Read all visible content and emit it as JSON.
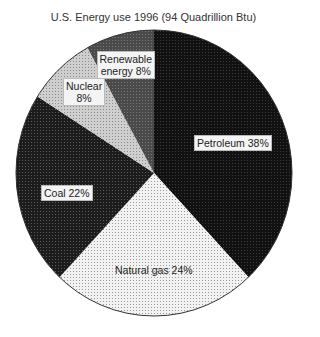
{
  "chart_data": {
    "type": "pie",
    "title": "U.S. Energy use 1996 (94 Quadrillion Btu)",
    "categories": [
      "Petroleum",
      "Natural gas",
      "Coal",
      "Nuclear",
      "Renewable energy"
    ],
    "values": [
      38,
      24,
      22,
      8,
      8
    ],
    "units": "%",
    "start_angle_deg": 0,
    "direction": "clockwise",
    "slices": [
      {
        "name": "Petroleum",
        "value": 38,
        "label": "Petroleum 38%",
        "fill": "#111111",
        "dot": "#3a3a3a",
        "label_x": 233,
        "label_y": 143,
        "boxed": true
      },
      {
        "name": "Natural gas",
        "value": 24,
        "label": "Natural gas 24%",
        "fill": "#f2f2f2",
        "dot": "#9a9a9a",
        "label_x": 154,
        "label_y": 270,
        "boxed": false
      },
      {
        "name": "Coal",
        "value": 22,
        "label": "Coal 22%",
        "fill": "#1c1c1c",
        "dot": "#5a5a5a",
        "label_x": 67,
        "label_y": 193,
        "boxed": true
      },
      {
        "name": "Nuclear",
        "value": 8,
        "label": "Nuclear\n8%",
        "fill": "#cfcfcf",
        "dot": "#8a8a8a",
        "label_x": 84,
        "label_y": 92,
        "boxed": true
      },
      {
        "name": "Renewable energy",
        "value": 8,
        "label": "Renewable\nenergy 8%",
        "fill": "#4a4a4a",
        "dot": "#7a7a7a",
        "label_x": 126,
        "label_y": 65,
        "boxed": true
      }
    ],
    "legend": "none",
    "grid": false
  },
  "geometry": {
    "cx": 154,
    "cy": 173,
    "rx": 138,
    "ry": 143
  }
}
